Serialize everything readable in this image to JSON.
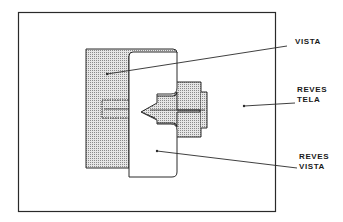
{
  "diagram": {
    "type": "technical-sewing-illustration",
    "labels": {
      "vista": "VISTA",
      "reves_tela_1": "REVES",
      "reves_tela_2": "TELA",
      "reves_vista_1": "REVES",
      "reves_vista_2": "VISTA"
    },
    "colors": {
      "ink": "#2a2a2a",
      "shaded_fill": "#cfcfcf",
      "paper": "#ffffff"
    }
  }
}
